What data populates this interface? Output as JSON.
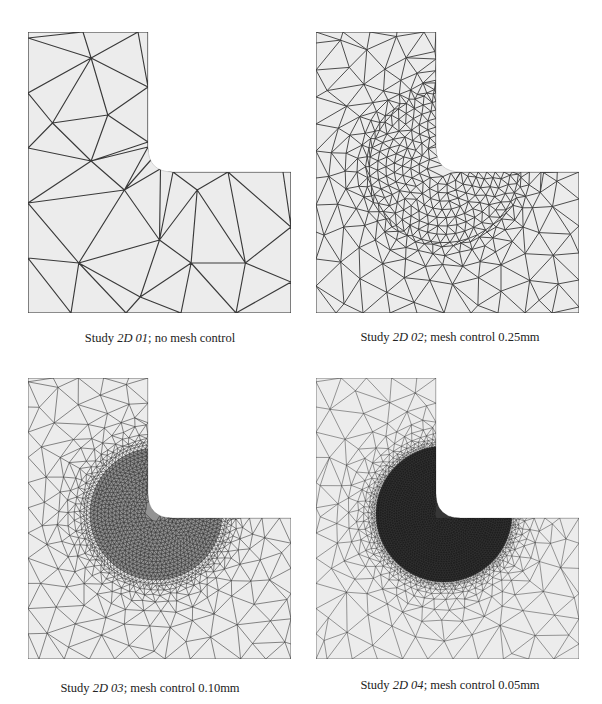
{
  "figure": {
    "panels": [
      {
        "id": "2d-01",
        "caption": {
          "prefix": "Study ",
          "study": "2D 01",
          "suffix": "; no mesh control"
        },
        "mesh_control_mm": null,
        "density": "coarse"
      },
      {
        "id": "2d-02",
        "caption": {
          "prefix": "Study ",
          "study": "2D 02",
          "suffix": "; mesh control 0.25mm"
        },
        "mesh_control_mm": 0.25,
        "density": "medium"
      },
      {
        "id": "2d-03",
        "caption": {
          "prefix": "Study ",
          "study": "2D 03",
          "suffix": "; mesh control 0.10mm"
        },
        "mesh_control_mm": 0.1,
        "density": "fine"
      },
      {
        "id": "2d-04",
        "caption": {
          "prefix": "Study ",
          "study": "2D 04",
          "suffix": "; mesh control 0.05mm"
        },
        "mesh_control_mm": 0.05,
        "density": "very-fine"
      }
    ],
    "colors": {
      "panel_fill": "#ececec",
      "mesh_line": "#3a3a3a",
      "background": "#ffffff"
    }
  }
}
